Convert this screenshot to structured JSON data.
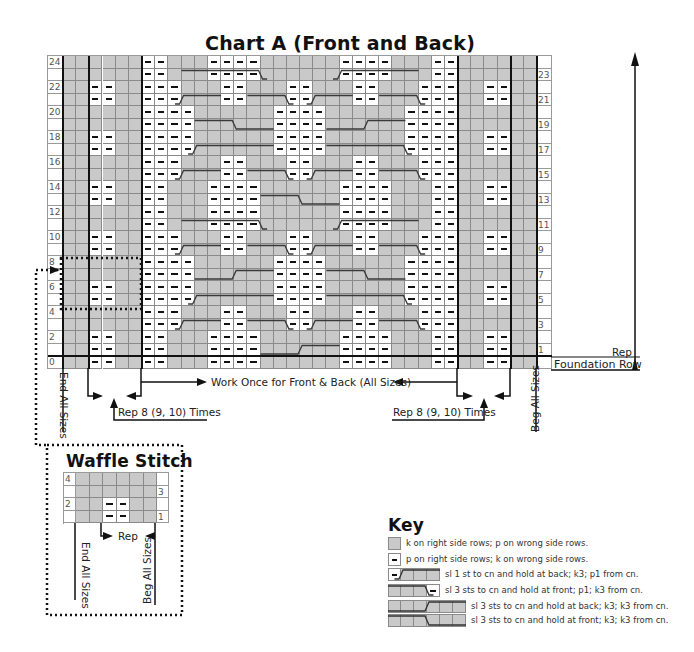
{
  "chart": {
    "title": "Chart A (Front and Back)",
    "left_row_numbers": [
      "24",
      "22",
      "20",
      "18",
      "16",
      "14",
      "12",
      "10",
      "8",
      "6",
      "4",
      "2",
      "0"
    ],
    "right_row_numbers": [
      "23",
      "21",
      "19",
      "17",
      "15",
      "13",
      "11",
      "9",
      "7",
      "5",
      "3",
      "1"
    ],
    "rows": 25,
    "section_left_purl_rows": [
      0,
      1,
      2,
      5,
      6,
      9,
      10,
      13,
      14,
      17,
      18,
      21,
      22
    ],
    "section_right_purl_rows": [
      0,
      1,
      2,
      5,
      6,
      9,
      10,
      13,
      14,
      17,
      18,
      21,
      22
    ],
    "middle_patterns": {
      "A": "--...----......----...--",
      "B": "---...--...--...--...---",
      "C": "----......----......----"
    },
    "middle_row_pattern": [
      "A",
      "A",
      "A",
      "B",
      "B",
      "C",
      "C",
      "C",
      "C",
      "B",
      "B",
      "A",
      "A",
      "A",
      "A",
      "B",
      "B",
      "C",
      "C",
      "C",
      "C",
      "B",
      "B",
      "A",
      "A"
    ],
    "cables": [
      {
        "row": 1,
        "x1": 9,
        "x2": 15,
        "step": 12,
        "dir": "up"
      },
      {
        "row": 3,
        "x1": 2.5,
        "x2": 6,
        "step": 3,
        "dir": "up"
      },
      {
        "row": 3,
        "x1": 8,
        "x2": 11.5,
        "step": 11,
        "dir": "down"
      },
      {
        "row": 3,
        "x1": 12.5,
        "x2": 16,
        "step": 13,
        "dir": "up"
      },
      {
        "row": 3,
        "x1": 18,
        "x2": 21.5,
        "step": 21,
        "dir": "down"
      },
      {
        "row": 5,
        "x1": 3.5,
        "x2": 10,
        "step": 4,
        "dir": "up"
      },
      {
        "row": 5,
        "x1": 14,
        "x2": 20.5,
        "step": 20,
        "dir": "down"
      },
      {
        "row": 7,
        "x1": 4,
        "x2": 10,
        "step": 7,
        "dir": "up"
      },
      {
        "row": 7,
        "x1": 14,
        "x2": 20,
        "step": 17,
        "dir": "down"
      },
      {
        "row": 9,
        "x1": 2.5,
        "x2": 6,
        "step": 3,
        "dir": "up"
      },
      {
        "row": 9,
        "x1": 8,
        "x2": 11.5,
        "step": 11,
        "dir": "down"
      },
      {
        "row": 9,
        "x1": 12.5,
        "x2": 16,
        "step": 13,
        "dir": "up"
      },
      {
        "row": 9,
        "x1": 18,
        "x2": 21.5,
        "step": 21,
        "dir": "down"
      },
      {
        "row": 11,
        "x1": 3,
        "x2": 9.5,
        "step": 9,
        "dir": "down"
      },
      {
        "row": 11,
        "x1": 14.5,
        "x2": 21,
        "step": 15,
        "dir": "up"
      },
      {
        "row": 13,
        "x1": 9,
        "x2": 15,
        "step": 12,
        "dir": "down"
      },
      {
        "row": 15,
        "x1": 2.5,
        "x2": 6,
        "step": 3,
        "dir": "up"
      },
      {
        "row": 15,
        "x1": 8,
        "x2": 11.5,
        "step": 11,
        "dir": "down"
      },
      {
        "row": 15,
        "x1": 12.5,
        "x2": 16,
        "step": 13,
        "dir": "up"
      },
      {
        "row": 15,
        "x1": 18,
        "x2": 21.5,
        "step": 21,
        "dir": "down"
      },
      {
        "row": 17,
        "x1": 3.5,
        "x2": 10,
        "step": 4,
        "dir": "up"
      },
      {
        "row": 17,
        "x1": 14,
        "x2": 20.5,
        "step": 20,
        "dir": "down"
      },
      {
        "row": 19,
        "x1": 4,
        "x2": 10,
        "step": 7,
        "dir": "down"
      },
      {
        "row": 19,
        "x1": 14,
        "x2": 20,
        "step": 17,
        "dir": "up"
      },
      {
        "row": 21,
        "x1": 2.5,
        "x2": 6,
        "step": 3,
        "dir": "up"
      },
      {
        "row": 21,
        "x1": 8,
        "x2": 11.5,
        "step": 11,
        "dir": "down"
      },
      {
        "row": 21,
        "x1": 12.5,
        "x2": 16,
        "step": 13,
        "dir": "up"
      },
      {
        "row": 21,
        "x1": 18,
        "x2": 21.5,
        "step": 21,
        "dir": "down"
      },
      {
        "row": 23,
        "x1": 3,
        "x2": 9.5,
        "step": 9,
        "dir": "down"
      },
      {
        "row": 23,
        "x1": 14.5,
        "x2": 21,
        "step": 15,
        "dir": "up"
      }
    ]
  },
  "annotations": {
    "rep_label": "Rep",
    "foundation_row": "Foundation Row",
    "work_once": "Work Once for Front & Back (All Sizes)",
    "rep_times_left": "Rep 8 (9, 10) Times",
    "rep_times_right": "Rep 8 (9, 10) Times",
    "end_all_sizes": "End All Sizes",
    "beg_all_sizes": "Beg All Sizes"
  },
  "waffle": {
    "title": "Waffle Stitch",
    "left_row_numbers": [
      "4",
      "",
      "2",
      ""
    ],
    "right_row_numbers": [
      "",
      "3",
      "",
      "1"
    ],
    "rows": [
      "......",
      "......",
      "..--..",
      "..--.."
    ],
    "rep_label": "Rep",
    "end_all_sizes": "End All Sizes",
    "beg_all_sizes": "Beg All Sizes"
  },
  "key": {
    "title": "Key",
    "items": [
      {
        "swatch": "knit",
        "label": "k on right side rows; p on wrong side rows."
      },
      {
        "swatch": "purl",
        "label": "p on right side rows; k on wrong side rows."
      },
      {
        "swatch": "cable-1-3-back",
        "label": "sl 1 st to cn and hold at back; k3; p1 from cn."
      },
      {
        "swatch": "cable-3-1-front",
        "label": "sl 3 sts to cn and hold at front; p1; k3 from cn."
      },
      {
        "swatch": "cable-3-3-back",
        "label": "sl 3 sts to cn and hold at back; k3; k3 from cn."
      },
      {
        "swatch": "cable-3-3-front",
        "label": "sl 3 sts to cn and hold at front; k3; k3 from cn."
      }
    ]
  },
  "colors": {
    "knit": "#c9c9c9",
    "purl": "#ffffff",
    "grid_line": "#8a8a8a",
    "ink": "#111111"
  }
}
